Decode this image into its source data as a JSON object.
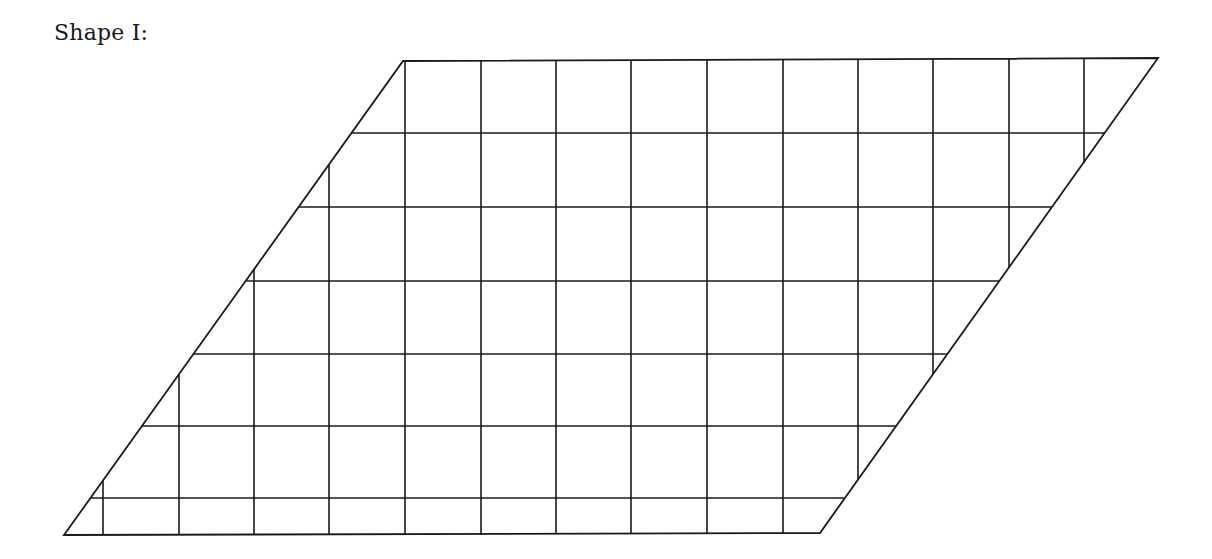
{
  "title": "Shape I:",
  "shape": {
    "type": "parallelogram",
    "stroke_color": "#1a1a1a",
    "vertices": {
      "top_left": [
        403,
        61
      ],
      "top_right": [
        1158,
        58
      ],
      "bottom_right": [
        820,
        533
      ],
      "bottom_left": [
        64,
        535
      ]
    },
    "grid": {
      "unit_square_px": 75,
      "horizontal_lines": [
        {
          "y": 133,
          "x1": 351,
          "x2": 1105
        },
        {
          "y": 207,
          "x1": 299,
          "x2": 1052
        },
        {
          "y": 281,
          "x1": 246,
          "x2": 999
        },
        {
          "y": 354,
          "x1": 193,
          "x2": 947
        },
        {
          "y": 426,
          "x1": 142,
          "x2": 896
        },
        {
          "y": 498,
          "x1": 90,
          "x2": 844
        }
      ],
      "vertical_lines": [
        {
          "x": 103,
          "y1": 481,
          "y2": 535
        },
        {
          "x": 179,
          "y1": 374,
          "y2": 535
        },
        {
          "x": 254,
          "y1": 269,
          "y2": 535
        },
        {
          "x": 329,
          "y1": 165,
          "y2": 535
        },
        {
          "x": 405,
          "y1": 61,
          "y2": 535
        },
        {
          "x": 481,
          "y1": 61,
          "y2": 535
        },
        {
          "x": 556,
          "y1": 61,
          "y2": 534
        },
        {
          "x": 631,
          "y1": 60,
          "y2": 534
        },
        {
          "x": 707,
          "y1": 60,
          "y2": 534
        },
        {
          "x": 783,
          "y1": 60,
          "y2": 533
        },
        {
          "x": 858,
          "y1": 59,
          "y2": 479
        },
        {
          "x": 933,
          "y1": 59,
          "y2": 374
        },
        {
          "x": 1009,
          "y1": 59,
          "y2": 268
        },
        {
          "x": 1084,
          "y1": 58,
          "y2": 163
        }
      ]
    }
  }
}
